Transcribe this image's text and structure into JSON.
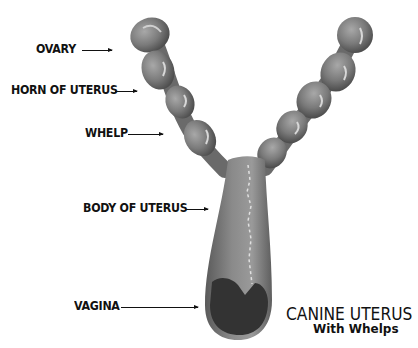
{
  "diagram": {
    "title": "CANINE UTERUS",
    "subtitle": "With Whelps",
    "labels": [
      {
        "text": "OVARY",
        "target": "ovary"
      },
      {
        "text": "HORN OF UTERUS",
        "target": "uterine-horn"
      },
      {
        "text": "WHELP",
        "target": "whelp"
      },
      {
        "text": "BODY OF UTERUS",
        "target": "uterine-body"
      },
      {
        "text": "VAGINA",
        "target": "vagina"
      }
    ],
    "colors": {
      "background": "#ffffff",
      "tissue": "#7a7a7a",
      "tissue_dark": "#4a4a4a",
      "highlight": "#d8d8d8",
      "opening": "#333333",
      "text": "#111111"
    }
  }
}
